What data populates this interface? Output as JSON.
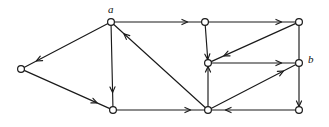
{
  "figure": {
    "type": "directed-graph",
    "width": 329,
    "height": 127,
    "background_color": "#ffffff",
    "ink_color": "#1a1a1a",
    "node_radius": 3.4,
    "labels": [
      {
        "text": "a",
        "node": "n_a",
        "x": 108,
        "y": 4
      },
      {
        "text": "b",
        "node": "n_b",
        "x": 308,
        "y": 54
      }
    ],
    "nodes": [
      {
        "id": "n_left",
        "label": "",
        "x": 21,
        "y": 69
      },
      {
        "id": "n_a",
        "label": "a",
        "x": 111,
        "y": 22
      },
      {
        "id": "n_top_mid",
        "label": "",
        "x": 205,
        "y": 22
      },
      {
        "id": "n_top_rt",
        "label": "",
        "x": 299,
        "y": 22
      },
      {
        "id": "n_center",
        "label": "",
        "x": 208,
        "y": 63
      },
      {
        "id": "n_b",
        "label": "b",
        "x": 299,
        "y": 63
      },
      {
        "id": "n_bot_lf",
        "label": "",
        "x": 113,
        "y": 110
      },
      {
        "id": "n_bot_mid",
        "label": "",
        "x": 208,
        "y": 110
      },
      {
        "id": "n_bot_rt",
        "label": "",
        "x": 299,
        "y": 110
      }
    ],
    "edges": [
      {
        "id": "e1",
        "from": "n_a",
        "to": "n_left",
        "arrow_at": "end"
      },
      {
        "id": "e2",
        "from": "n_left",
        "to": "n_bot_lf",
        "arrow_at": "end"
      },
      {
        "id": "e3",
        "from": "n_a",
        "to": "n_bot_lf",
        "arrow_at": "end"
      },
      {
        "id": "e4",
        "from": "n_a",
        "to": "n_top_mid",
        "arrow_at": "end"
      },
      {
        "id": "e5",
        "from": "n_top_mid",
        "to": "n_top_rt",
        "arrow_at": "end"
      },
      {
        "id": "e6",
        "from": "n_top_mid",
        "to": "n_center",
        "arrow_at": "end"
      },
      {
        "id": "e7",
        "from": "n_top_rt",
        "to": "n_center",
        "arrow_at": "end"
      },
      {
        "id": "e8",
        "from": "n_top_rt",
        "to": "n_b",
        "arrow_at": "none"
      },
      {
        "id": "e9",
        "from": "n_center",
        "to": "n_b",
        "arrow_at": "end"
      },
      {
        "id": "e10",
        "from": "n_bot_mid",
        "to": "n_center",
        "arrow_at": "end"
      },
      {
        "id": "e11",
        "from": "n_bot_mid",
        "to": "n_a",
        "arrow_at": "end"
      },
      {
        "id": "e12",
        "from": "n_bot_lf",
        "to": "n_bot_mid",
        "arrow_at": "end"
      },
      {
        "id": "e13",
        "from": "n_bot_mid",
        "to": "n_b",
        "arrow_at": "end"
      },
      {
        "id": "e14",
        "from": "n_b",
        "to": "n_bot_rt",
        "arrow_at": "end"
      },
      {
        "id": "e15",
        "from": "n_bot_rt",
        "to": "n_bot_mid",
        "arrow_at": "end"
      }
    ]
  }
}
